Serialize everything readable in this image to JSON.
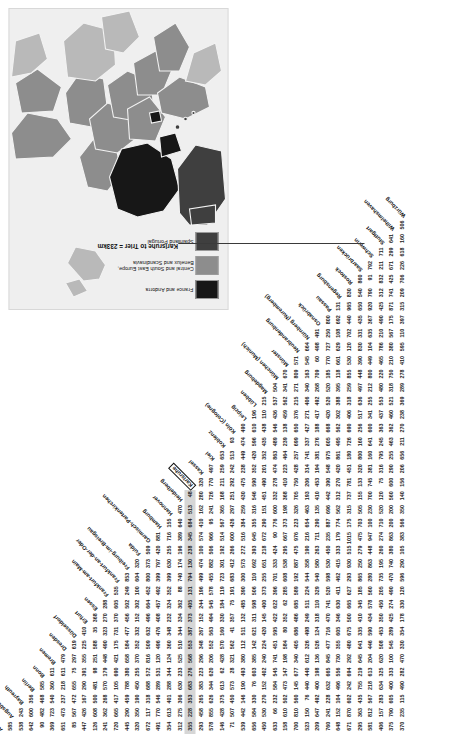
{
  "figure": {
    "annotation": "Karlsruhe to Trier = 233km",
    "highlight_row_city": "Karlsruhe",
    "highlight_col_city": "Trier",
    "highlight_value": 233,
    "units": "km"
  },
  "map": {
    "title": "Europe inset map",
    "legend": [
      {
        "label": "France and Andorra",
        "color": "#171717"
      },
      {
        "label": "Central and South East Europe,\nBenelux and Scandinavia",
        "color": "#8d8d8d"
      },
      {
        "label": "Spain and Portugal",
        "color": "#3f3f3f"
      }
    ],
    "colors": {
      "sea": "#efefef",
      "land_other": "#b9b9b9",
      "france": "#171717",
      "central": "#8d8d8d",
      "iberia": "#3f3f3f",
      "border": "#f2f2f2"
    }
  },
  "chart_data": {
    "type": "table",
    "title": "Karlsruhe to Trier = 233km",
    "xlabel": "",
    "ylabel": "",
    "matrix_form": "lower-triangular",
    "units": "km",
    "categories": [
      "Aachen",
      "Augsburg",
      "Bayreuth",
      "Berlin",
      "Bonn",
      "Bremen",
      "Dresden",
      "Düsseldorf",
      "Erfurt",
      "Essen",
      "Frankfurt-am-Main",
      "Frankfurt-an-der-Oder",
      "Freiburg-im-Breisgau",
      "Fulda",
      "Garmisch-Partenkirchen",
      "Hamburg",
      "Hannover",
      "Heidelberg",
      "Karlsruhe",
      "Kassel",
      "Kiel",
      "Koblenz",
      "Köln (Cologne)",
      "Leipzig",
      "Lübben",
      "Magdeburg",
      "München (Munich)",
      "Münster",
      "Neubrandenburg",
      "Nürnberg (Nuremberg)",
      "Osnabrück",
      "Passau",
      "Regensburg",
      "Rostock",
      "Saarbrücken",
      "Schwerin",
      "Stuttgart",
      "Wilhelmshaven",
      "Würzburg"
    ],
    "rows": [
      {
        "city": "Augsburg",
        "values": [
          585
        ]
      },
      {
        "city": "Bayreuth",
        "values": [
          538,
          243
        ]
      },
      {
        "city": "Berlin",
        "values": [
          642,
          600,
          356
        ]
      },
      {
        "city": "Bonn",
        "values": [
          90,
          482,
          468,
          585
        ]
      },
      {
        "city": "Bremen",
        "values": [
          369,
          723,
          540,
          360,
          611
        ]
      },
      {
        "city": "Dresden",
        "values": [
          651,
          473,
          237,
          218,
          611,
          479
        ]
      },
      {
        "city": "Düsseldorf",
        "values": [
          85,
          567,
          472,
          655,
          75,
          297,
          619
        ]
      },
      {
        "city": "Erfurt",
        "values": [
          447,
          426,
          167,
          290,
          391,
          355,
          225,
          410
        ]
      },
      {
        "city": "Essen",
        "values": [
          126,
          608,
          500,
          481,
          98,
          251,
          588,
          35,
          368
        ]
      },
      {
        "city": "Frankfurt-am-Main",
        "values": [
          241,
          362,
          268,
          570,
          179,
          448,
          490,
          323,
          270,
          288
        ]
      },
      {
        "city": "Frankfurt-an-der-Oder",
        "values": [
          720,
          665,
          417,
          105,
          690,
          421,
          175,
          731,
          370,
          605,
          535
        ]
      },
      {
        "city": "Freiburg-im-Breisgau",
        "values": [
          445,
          290,
          459,
          788,
          380,
          658,
          584,
          477,
          456,
          502,
          249,
          853
        ]
      },
      {
        "city": "Fulda",
        "values": [
          320,
          350,
          190,
          450,
          255,
          370,
          352,
          332,
          152,
          302,
          100,
          604,
          320
        ]
      },
      {
        "city": "Garmisch-Partenkirchen",
        "values": [
          672,
          117,
          318,
          688,
          572,
          816,
          509,
          632,
          496,
          664,
          452,
          800,
          373,
          509
        ]
      },
      {
        "city": "Hamburg",
        "values": [
          491,
          770,
          546,
          289,
          531,
          120,
          496,
          476,
          408,
          457,
          492,
          399,
          797,
          420,
          881
        ]
      },
      {
        "city": "Hannover",
        "values": [
          354,
          613,
          401,
          288,
          344,
          124,
          360,
          348,
          232,
          324,
          352,
          399,
          630,
          255,
          716,
          155
        ]
      },
      {
        "city": "Heidelberg",
        "values": [
          312,
          275,
          306,
          630,
          233,
          525,
          510,
          344,
          334,
          362,
          88,
          740,
          174,
          196,
          389,
          640,
          470
        ]
      },
      {
        "city": "Karlsruhe",
        "values": [
          355,
          228,
          353,
          683,
          276,
          568,
          553,
          387,
          373,
          405,
          131,
          794,
          130,
          238,
          345,
          684,
          513,
          48
        ]
      },
      {
        "city": "Kassel",
        "values": [
          293,
          458,
          265,
          383,
          223,
          296,
          348,
          267,
          152,
          244,
          196,
          499,
          474,
          100,
          574,
          410,
          162,
          280,
          320
        ]
      },
      {
        "city": "Kiel",
        "values": [
          578,
          855,
          626,
          344,
          620,
          206,
          552,
          563,
          494,
          545,
          578,
          455,
          882,
          506,
          966,
          95,
          241,
          726,
          770,
          497
        ]
      },
      {
        "city": "Koblenz",
        "values": [
          146,
          428,
          375,
          613,
          62,
          428,
          570,
          160,
          330,
          184,
          119,
          723,
          301,
          192,
          514,
          567,
          365,
          168,
          211,
          259,
          653
        ]
      },
      {
        "city": "Köln (Cologne)",
        "values": [
          71,
          507,
          450,
          573,
          28,
          321,
          562,
          41,
          357,
          75,
          191,
          683,
          412,
          266,
          600,
          426,
          297,
          251,
          292,
          242,
          513,
          93
        ]
      },
      {
        "city": "Leipzig",
        "values": [
          539,
          442,
          146,
          190,
          493,
          380,
          112,
          511,
          132,
          485,
          390,
          300,
          573,
          272,
          516,
          384,
          259,
          430,
          475,
          238,
          449,
          474,
          490
        ]
      },
      {
        "city": "Lübben",
        "values": [
          656,
          584,
          330,
          76,
          603,
          385,
          142,
          621,
          311,
          598,
          506,
          110,
          692,
          393,
          645,
          355,
          316,
          546,
          590,
          352,
          420,
          596,
          610,
          196
        ]
      },
      {
        "city": "Magdeburg",
        "values": [
          450,
          530,
          270,
          152,
          402,
          240,
          224,
          420,
          145,
          400,
          373,
          255,
          651,
          218,
          672,
          290,
          151,
          451,
          490,
          201,
          352,
          435,
          438,
          110,
          215
        ]
      },
      {
        "city": "München (Munich)",
        "values": [
          633,
          66,
          232,
          584,
          545,
          741,
          451,
          595,
          422,
          622,
          396,
          701,
          333,
          424,
          90,
          776,
          600,
          332,
          278,
          474,
          863,
          489,
          546,
          436,
          537,
          504
        ]
      },
      {
        "city": "Münster",
        "values": [
          158,
          610,
          502,
          473,
          147,
          198,
          584,
          80,
          352,
          62,
          285,
          608,
          538,
          295,
          667,
          373,
          198,
          368,
          410,
          223,
          464,
          239,
          138,
          459,
          562,
          341,
          670
        ]
      },
      {
        "city": "Neubrandenburg",
        "values": [
          700,
          810,
          560,
          145,
          677,
          340,
          405,
          686,
          486,
          685,
          589,
          192,
          887,
          475,
          976,
          223,
          326,
          705,
          750,
          428,
          257,
          699,
          650,
          376,
          215,
          271,
          809,
          571
        ]
      },
      {
        "city": "Nürnberg (Nuremberg)",
        "values": [
          523,
          150,
          76,
          440,
          440,
          612,
          326,
          498,
          249,
          511,
          224,
          544,
          358,
          190,
          216,
          654,
          463,
          193,
          206,
          314,
          741,
          337,
          427,
          271,
          406,
          340,
          163,
          545,
          664
        ]
      },
      {
        "city": "Osnabrück",
        "values": [
          209,
          647,
          492,
          400,
          198,
          136,
          526,
          124,
          318,
          110,
          329,
          540,
          580,
          263,
          711,
          290,
          135,
          410,
          453,
          194,
          381,
          276,
          188,
          417,
          492,
          268,
          709,
          60,
          498,
          491
        ]
      },
      {
        "city": "Passau",
        "values": [
          760,
          241,
          228,
          632,
          665,
          845,
          477,
          716,
          470,
          741,
          520,
          598,
          530,
          450,
          235,
          887,
          696,
          442,
          390,
          548,
          975,
          605,
          668,
          420,
          520,
          520,
          185,
          770,
          727,
          250,
          800
        ]
      },
      {
        "city": "Regensburg",
        "values": [
          648,
          152,
          104,
          496,
          556,
          730,
          355,
          605,
          346,
          630,
          411,
          462,
          415,
          333,
          179,
          774,
          562,
          312,
          270,
          420,
          861,
          495,
          562,
          302,
          388,
          395,
          118,
          661,
          629,
          108,
          692,
          131
        ]
      },
      {
        "city": "Rostock",
        "values": [
          671,
          870,
          602,
          242,
          694,
          292,
          480,
          675,
          500,
          665,
          627,
          293,
          930,
          515,
          1015,
          175,
          315,
          737,
          781,
          451,
          180,
          726,
          690,
          406,
          318,
          259,
          855,
          530,
          120,
          702,
          440,
          965,
          830
        ]
      },
      {
        "city": "Saarbrücken",
        "values": [
          295,
          363,
          435,
          755,
          219,
          645,
          641,
          335,
          410,
          345,
          185,
          865,
          250,
          279,
          475,
          703,
          505,
          155,
          133,
          320,
          800,
          160,
          256,
          517,
          636,
          497,
          448,
          390,
          830,
          331,
          435,
          650,
          540,
          860
        ]
      },
      {
        "city": "Schwerin",
        "values": [
          581,
          812,
          567,
          218,
          613,
          204,
          446,
          590,
          434,
          578,
          560,
          280,
          863,
          448,
          947,
          100,
          230,
          700,
          745,
          381,
          160,
          641,
          600,
          341,
          255,
          212,
          800,
          449,
          104,
          635,
          367,
          920,
          790,
          91,
          792
        ]
      },
      {
        "city": "Stuttgart",
        "values": [
          406,
          157,
          283,
          634,
          325,
          620,
          508,
          453,
          350,
          450,
          205,
          735,
          195,
          260,
          274,
          710,
          520,
          120,
          75,
          316,
          795,
          245,
          363,
          437,
          553,
          480,
          220,
          465,
          786,
          210,
          490,
          425,
          312,
          832,
          211,
          711
        ]
      },
      {
        "city": "Wilhelmshaven",
        "values": [
          375,
          790,
          605,
          400,
          333,
          100,
          545,
          289,
          425,
          274,
          490,
          470,
          740,
          380,
          863,
          200,
          200,
          560,
          600,
          290,
          255,
          463,
          362,
          460,
          521,
          318,
          750,
          210,
          380,
          567,
          175,
          871,
          741,
          425,
          671,
          299,
          641
        ]
      },
      {
        "city": "Würzburg",
        "values": [
          370,
          235,
          115,
          490,
          282,
          470,
          330,
          354,
          178,
          330,
          120,
          596,
          290,
          105,
          383,
          566,
          350,
          140,
          156,
          206,
          656,
          211,
          270,
          238,
          369,
          289,
          278,
          410,
          595,
          110,
          397,
          315,
          209,
          706,
          226,
          618,
          160,
          506
        ]
      }
    ]
  }
}
